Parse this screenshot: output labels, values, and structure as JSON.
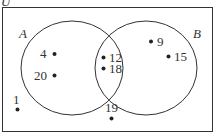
{
  "diagram": {
    "type": "venn",
    "universal_label": "U",
    "sets": [
      {
        "name": "A",
        "label": "A"
      },
      {
        "name": "B",
        "label": "B"
      }
    ],
    "elements": {
      "A_only": [
        "4",
        "20"
      ],
      "A_and_B": [
        "12",
        "18"
      ],
      "B_only": [
        "9",
        "15"
      ],
      "outside": [
        "1",
        "19"
      ]
    },
    "labels": {
      "u": "U",
      "a": "A",
      "b": "B",
      "e4": "4",
      "e20": "20",
      "e12": "12",
      "e18": "18",
      "e9": "9",
      "e15": "15",
      "e1": "1",
      "e19": "19"
    },
    "colors": {
      "stroke": "#333333",
      "dot": "#222222",
      "background": "#ffffff"
    }
  }
}
